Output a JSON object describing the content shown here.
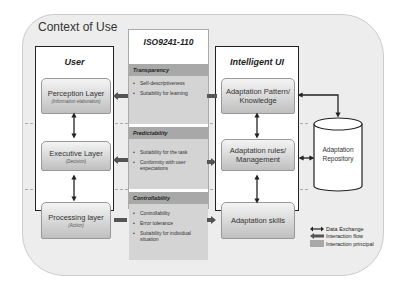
{
  "context": {
    "title": "Context of Use"
  },
  "columns": {
    "user": {
      "title": "User",
      "layers": [
        {
          "label": "Perception Layer",
          "sub": "(Information elaboration)"
        },
        {
          "label": "Executive Layer",
          "sub": "(Decision)"
        },
        {
          "label": "Processing layer",
          "sub": "(Action)"
        }
      ]
    },
    "iso": {
      "title": "ISO9241-110",
      "principles": [
        {
          "name": "Transparency",
          "items": [
            "Self-descriptiveness",
            "Suitability for learning"
          ]
        },
        {
          "name": "Predictability",
          "items": [
            "Suitability for the task",
            "Conformity with user expectations"
          ]
        },
        {
          "name": "Controllability",
          "items": [
            "Controllability",
            "Error tolerance",
            "Suitability for individual situation"
          ]
        }
      ]
    },
    "iui": {
      "title": "Intelligent UI",
      "layers": [
        {
          "label": "Adaptation Pattern/ Knowledge"
        },
        {
          "label": "Adaptation rules/ Management"
        },
        {
          "label": "Adaptation skills"
        }
      ]
    }
  },
  "repository": {
    "label": "Adaptation Repository"
  },
  "legend": {
    "items": [
      {
        "symbol": "double-arrow",
        "label": "Data Exchange"
      },
      {
        "symbol": "thick-arrow",
        "label": "Interaction flow"
      },
      {
        "symbol": "gray-box",
        "label": "Interaction principal"
      }
    ]
  },
  "colors": {
    "context_bg": "#ededed",
    "principle_head": "#a8a8a8",
    "principle_body": "#d4d4d4",
    "arrow": "#222222",
    "interaction_arrow": "#555555",
    "dash": "#aaaaaa"
  }
}
